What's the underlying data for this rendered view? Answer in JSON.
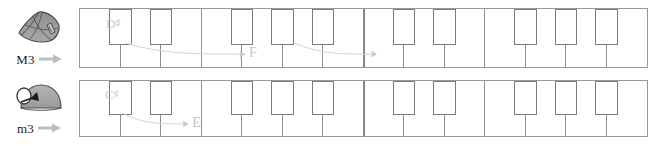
{
  "figure": {
    "type": "music-interval-diagram",
    "background": "#ffffff",
    "key_outline_color": "#8e8e8e",
    "annotation_color": "#cccccc"
  },
  "rows": [
    {
      "id": "major-third",
      "interval_label": "M3",
      "interval_name": "major third",
      "icon": "wedge-fan-icon",
      "icon_arrow": "right-arrow-icon",
      "keyboard": {
        "white_key_count": 14,
        "black_key_pattern": [
          1,
          1,
          0,
          1,
          1,
          1,
          0
        ],
        "octave_split_after_white_key": 7
      },
      "annotations": [
        {
          "from_note": "D",
          "from_accidental": "♯",
          "from_label": "D♯",
          "to_note": "F",
          "to_label": "F",
          "semitones": 4,
          "arrow": "curved-right-arrow"
        },
        {
          "from_note": "",
          "from_accidental": "",
          "from_label": "",
          "to_note": "",
          "to_label": "",
          "semitones": 4,
          "arrow": "curved-right-arrow"
        }
      ]
    },
    {
      "id": "minor-third",
      "interval_label": "m3",
      "interval_name": "minor third",
      "icon": "dome-ball-icon",
      "icon_arrow": "right-arrow-icon",
      "keyboard": {
        "white_key_count": 14,
        "black_key_pattern": [
          1,
          1,
          0,
          1,
          1,
          1,
          0
        ],
        "octave_split_after_white_key": 7
      },
      "annotations": [
        {
          "from_note": "C",
          "from_accidental": "♯",
          "from_label": "C♯",
          "to_note": "E",
          "to_label": "E",
          "semitones": 3,
          "arrow": "curved-right-arrow"
        }
      ]
    }
  ]
}
